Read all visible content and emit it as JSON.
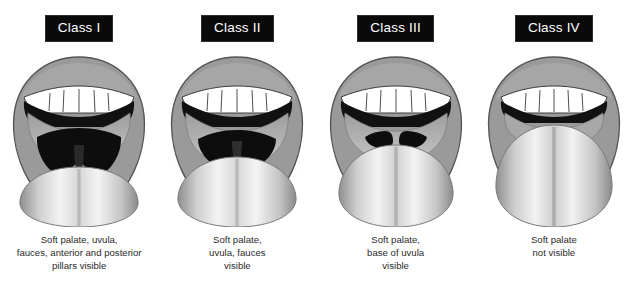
{
  "background_color": "#ffffff",
  "label_style": {
    "background_color": "#0a0a0a",
    "text_color": "#ffffff"
  },
  "caption_color": "#2b2b2b",
  "palette": {
    "lip": "#9a9a9a",
    "lip_outline": "#4f4f4f",
    "oral_mucosa": "#b0b0b0",
    "pharynx_dark": "#0d0d0d",
    "tongue_light": "#f2f2f2",
    "tongue_mid": "#bdbdbd",
    "tongue_shadow": "#8d8d8d",
    "teeth": "#ffffff",
    "halo": "#d8d8d8"
  },
  "panels": [
    {
      "id": "class-1",
      "label": "Class I",
      "caption_lines": [
        "Soft palate, uvula,",
        "fauces, anterior and posterior",
        "pillars visible"
      ],
      "visible_structures": [
        "soft palate",
        "uvula",
        "fauces",
        "anterior pillars",
        "posterior pillars"
      ],
      "pharynx_opening": "large"
    },
    {
      "id": "class-2",
      "label": "Class II",
      "caption_lines": [
        "Soft palate,",
        "uvula, fauces",
        "visible"
      ],
      "visible_structures": [
        "soft palate",
        "uvula",
        "fauces"
      ],
      "pharynx_opening": "moderate"
    },
    {
      "id": "class-3",
      "label": "Class III",
      "caption_lines": [
        "Soft palate,",
        "base of uvula",
        "visible"
      ],
      "visible_structures": [
        "soft palate",
        "base of uvula"
      ],
      "pharynx_opening": "small"
    },
    {
      "id": "class-4",
      "label": "Class IV",
      "caption_lines": [
        "Soft palate",
        "not visible"
      ],
      "visible_structures": [],
      "pharynx_opening": "none"
    }
  ]
}
